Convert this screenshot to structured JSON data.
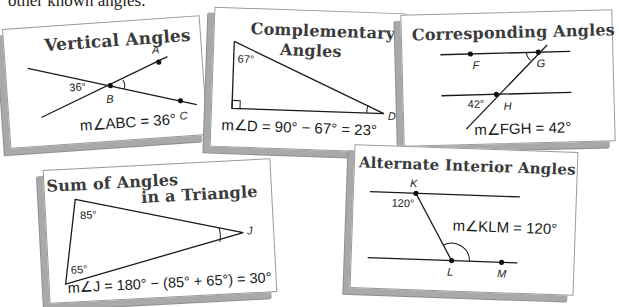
{
  "intro_text": "other known angles.",
  "cards": {
    "vertical": {
      "title": "Vertical Angles",
      "labels": {
        "A": "A",
        "B": "B",
        "C": "C",
        "angle": "36°"
      },
      "equation": "m∠ABC = 36°"
    },
    "complementary": {
      "title_line1": "Complementary",
      "title_line2": "Angles",
      "labels": {
        "D": "D",
        "angle": "67°"
      },
      "equation": "m∠D = 90° − 67° = 23°"
    },
    "corresponding": {
      "title": "Corresponding Angles",
      "labels": {
        "F": "F",
        "G": "G",
        "H": "H",
        "angle": "42°"
      },
      "equation": "m∠FGH = 42°"
    },
    "triangle": {
      "title_line1": "Sum of Angles",
      "title_line2": "in a Triangle",
      "labels": {
        "J": "J",
        "top_angle": "85°",
        "bottom_angle": "65°"
      },
      "equation": "m∠J = 180° − (85° + 65°) = 30°"
    },
    "alternate": {
      "title": "Alternate Interior Angles",
      "labels": {
        "K": "K",
        "L": "L",
        "M": "M",
        "angle": "120°"
      },
      "equation": "m∠KLM = 120°"
    }
  },
  "colors": {
    "line": "#1a1a1a",
    "title": "#3a3a3a",
    "shadow": "#a9a9a9"
  }
}
